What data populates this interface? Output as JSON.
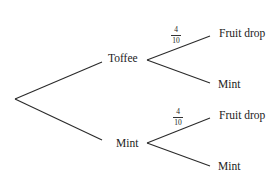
{
  "diagram": {
    "type": "probability-tree",
    "line_color": "#2a2a2a",
    "level1": [
      {
        "label": "Toffee"
      },
      {
        "label": "Mint"
      }
    ],
    "level2": {
      "toffee": [
        {
          "label": "Fruit drop",
          "probability": {
            "numerator": "4",
            "denominator": "10"
          }
        },
        {
          "label": "Mint"
        }
      ],
      "mint": [
        {
          "label": "Fruit drop",
          "probability": {
            "numerator": "4",
            "denominator": "10"
          }
        },
        {
          "label": "Mint"
        }
      ]
    }
  }
}
